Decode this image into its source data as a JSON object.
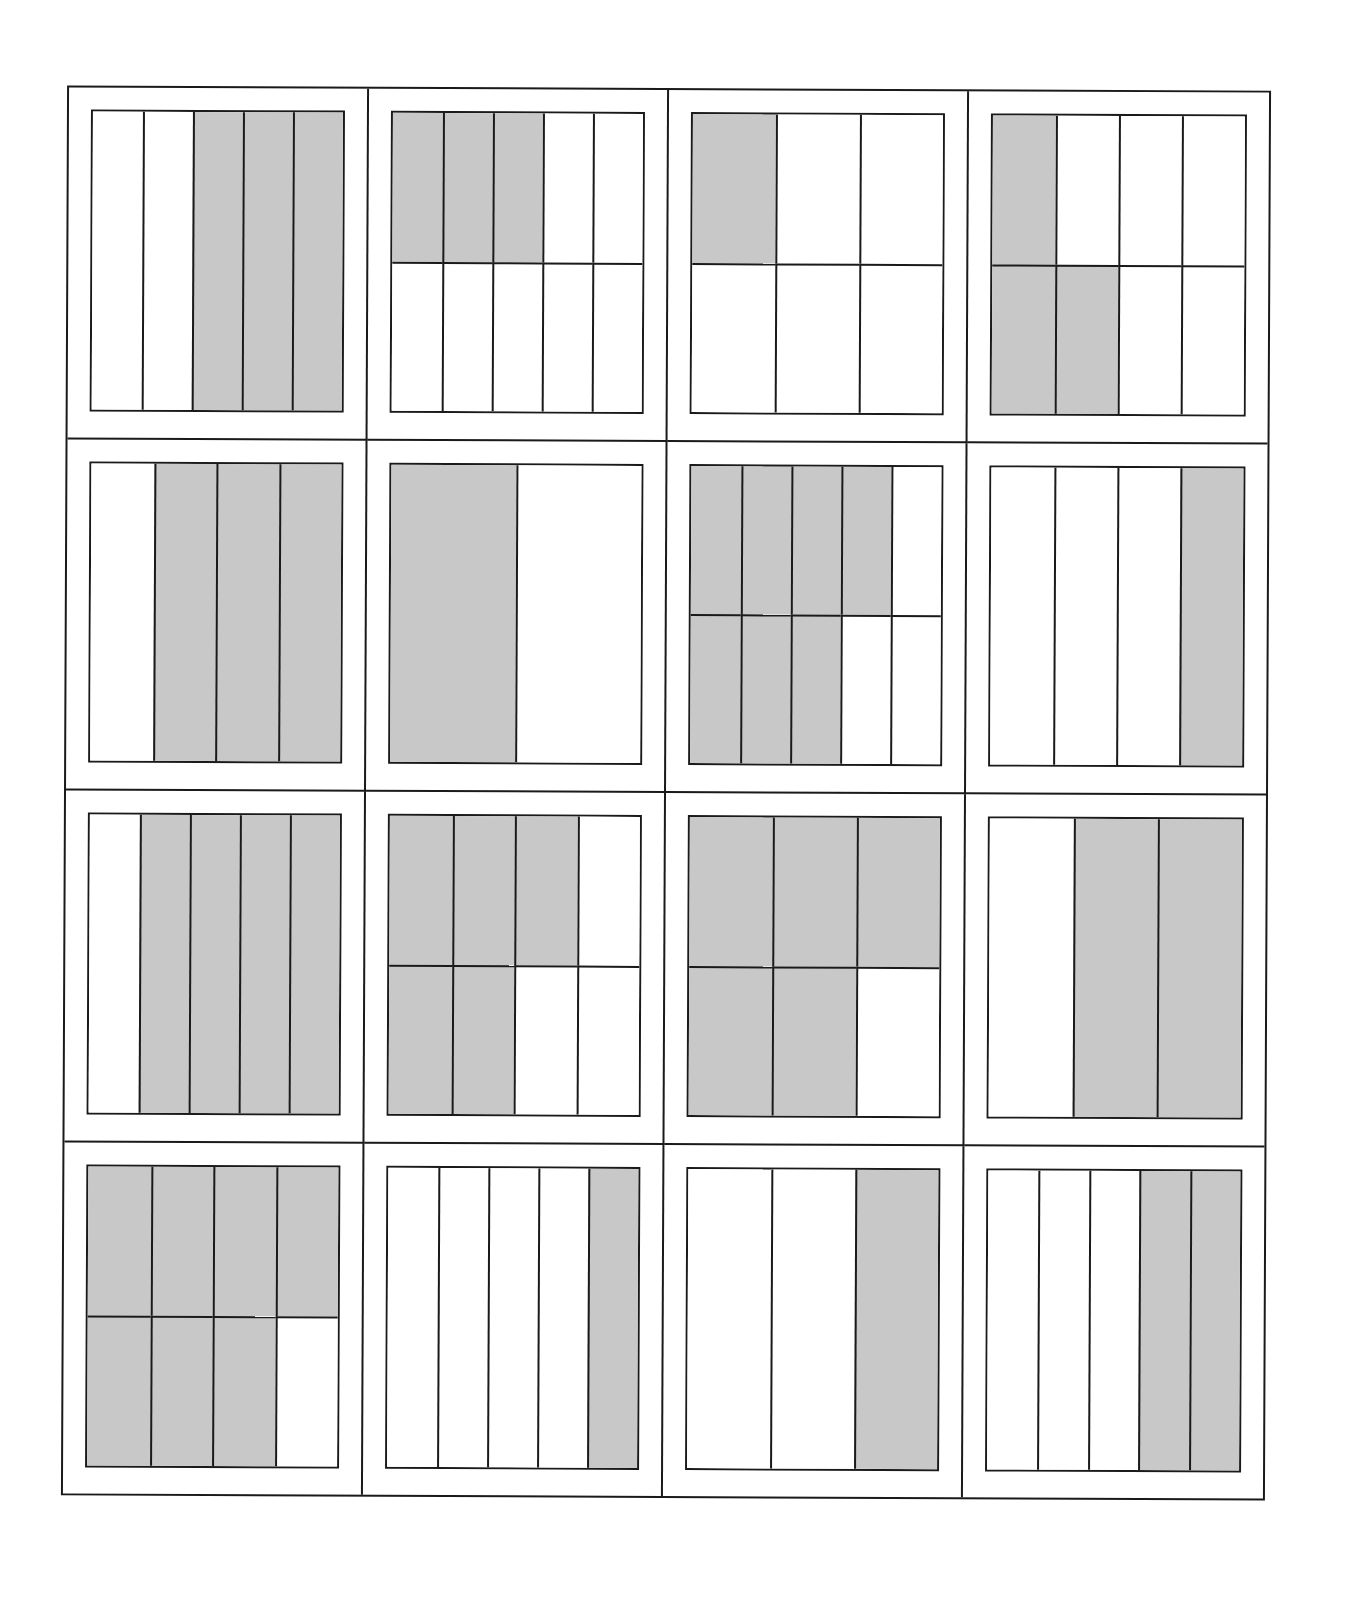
{
  "worksheet": {
    "title": "Fraction models grid",
    "rows": 4,
    "columns": 4,
    "colors": {
      "shaded": "#c8c8c8",
      "unshaded": "#ffffff",
      "line": "#1a1a1a"
    },
    "models": [
      {
        "row": 1,
        "col": 1,
        "grid_rows": 1,
        "grid_cols": 5,
        "shaded": [
          2,
          3,
          4
        ],
        "fraction": "3/5"
      },
      {
        "row": 1,
        "col": 2,
        "grid_rows": 2,
        "grid_cols": 5,
        "shaded": [
          0,
          1,
          2
        ],
        "fraction": "3/10"
      },
      {
        "row": 1,
        "col": 3,
        "grid_rows": 2,
        "grid_cols": 3,
        "shaded": [
          0
        ],
        "fraction": "1/6"
      },
      {
        "row": 1,
        "col": 4,
        "grid_rows": 2,
        "grid_cols": 4,
        "shaded": [
          0,
          4,
          5
        ],
        "fraction": "3/8"
      },
      {
        "row": 2,
        "col": 1,
        "grid_rows": 1,
        "grid_cols": 4,
        "shaded": [
          1,
          2,
          3
        ],
        "fraction": "3/4"
      },
      {
        "row": 2,
        "col": 2,
        "grid_rows": 1,
        "grid_cols": 2,
        "shaded": [
          0
        ],
        "fraction": "1/2"
      },
      {
        "row": 2,
        "col": 3,
        "grid_rows": 2,
        "grid_cols": 5,
        "shaded": [
          0,
          1,
          2,
          3,
          5,
          6,
          7
        ],
        "fraction": "7/10"
      },
      {
        "row": 2,
        "col": 4,
        "grid_rows": 1,
        "grid_cols": 4,
        "shaded": [
          3
        ],
        "fraction": "1/4"
      },
      {
        "row": 3,
        "col": 1,
        "grid_rows": 1,
        "grid_cols": 5,
        "shaded": [
          1,
          2,
          3,
          4
        ],
        "fraction": "4/5"
      },
      {
        "row": 3,
        "col": 2,
        "grid_rows": 2,
        "grid_cols": 4,
        "shaded": [
          0,
          1,
          2,
          4,
          5
        ],
        "fraction": "5/8"
      },
      {
        "row": 3,
        "col": 3,
        "grid_rows": 2,
        "grid_cols": 3,
        "shaded": [
          0,
          1,
          2,
          3,
          4
        ],
        "fraction": "5/6"
      },
      {
        "row": 3,
        "col": 4,
        "grid_rows": 1,
        "grid_cols": 3,
        "shaded": [
          1,
          2
        ],
        "fraction": "2/3"
      },
      {
        "row": 4,
        "col": 1,
        "grid_rows": 2,
        "grid_cols": 4,
        "shaded": [
          0,
          1,
          2,
          3,
          4,
          5,
          6
        ],
        "fraction": "7/8"
      },
      {
        "row": 4,
        "col": 2,
        "grid_rows": 1,
        "grid_cols": 5,
        "shaded": [
          4
        ],
        "fraction": "1/5"
      },
      {
        "row": 4,
        "col": 3,
        "grid_rows": 1,
        "grid_cols": 3,
        "shaded": [
          2
        ],
        "fraction": "1/3"
      },
      {
        "row": 4,
        "col": 4,
        "grid_rows": 1,
        "grid_cols": 5,
        "shaded": [
          3,
          4
        ],
        "fraction": "2/5"
      }
    ]
  }
}
